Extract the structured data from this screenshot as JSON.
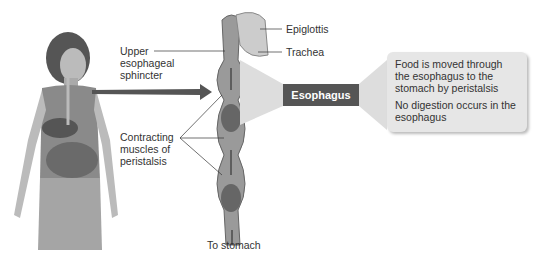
{
  "labels": {
    "epiglottis": "Epiglottis",
    "trachea": "Trachea",
    "upper_sphincter": [
      "Upper",
      "esophageal",
      "sphincter"
    ],
    "contracting": [
      "Contracting",
      "muscles of",
      "peristalsis"
    ],
    "to_stomach": "To stomach"
  },
  "organ_box": {
    "label": "Esophagus",
    "color": "#555555"
  },
  "callout": {
    "points": [
      "Food is moved through the esophagus to the stomach by peristalsis",
      "No digestion occurs in the esophagus"
    ],
    "bg_color": "#e6e6e6"
  }
}
